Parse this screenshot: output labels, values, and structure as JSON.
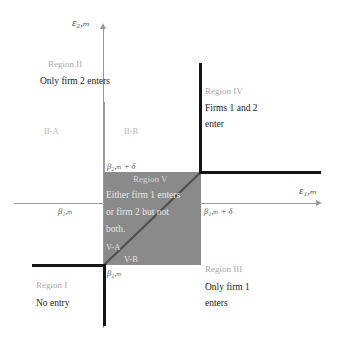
{
  "figure": {
    "type": "diagram",
    "axes": {
      "x_label": "ε₁,ₘ",
      "y_label": "ε₂,ₘ",
      "x_ticks": [
        {
          "label": "β₁,ₘ",
          "meaning": "beta-1-m"
        },
        {
          "label": "β₁,ₘ + δ",
          "meaning": "beta-1-m-plus-delta"
        }
      ],
      "y_ticks": [
        {
          "label": "β₂,ₘ",
          "meaning": "beta-2-m"
        },
        {
          "label": "β₂,ₘ + δ",
          "meaning": "beta-2-m-plus-delta"
        }
      ]
    },
    "regions": [
      {
        "id": "I",
        "tag": "Region I",
        "lines": [
          "No entry"
        ]
      },
      {
        "id": "II",
        "tag": "Region II",
        "lines": [
          "Only firm 2 enters"
        ],
        "subregions": [
          "II-A",
          "II-B"
        ]
      },
      {
        "id": "III",
        "tag": "Region III",
        "lines": [
          "Only firm 1",
          "enters"
        ]
      },
      {
        "id": "IV",
        "tag": "Region IV",
        "lines": [
          "Firms 1 and 2",
          "enter"
        ]
      },
      {
        "id": "V",
        "tag": "Region V",
        "lines": [
          "Either firm 1 enters",
          "or firm 2 but not",
          "both."
        ],
        "subregions": [
          "V-A",
          "V-B"
        ]
      }
    ],
    "colors": {
      "shaded_region": "#8a8a8a",
      "axis": "#9a9a9a",
      "boundary": "#151515",
      "tag_text": "#a8a8a8",
      "body_text": "#1a1a1a",
      "background": "#ffffff"
    }
  }
}
